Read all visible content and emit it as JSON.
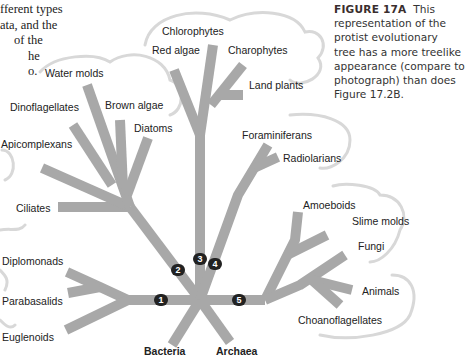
{
  "intro_text": {
    "lines": [
      "fferent types",
      "ata, and the",
      "of the",
      "he",
      "o."
    ]
  },
  "caption": {
    "figure_label": "FIGURE 17A",
    "lines": [
      "This",
      "representation of the",
      "protist evolutionary",
      "tree has a more treelike",
      "appearance (compare to",
      "photograph) than does",
      "Figure 17.2B."
    ]
  },
  "colors": {
    "branch": "#a8a8a8",
    "cloud_outline": "#d6d6d6",
    "node_fill": "#222222",
    "node_text": "#ffffff"
  },
  "tree": {
    "labels": {
      "chlorophytes": "Chlorophytes",
      "red_algae": "Red algae",
      "charophytes": "Charophytes",
      "land_plants": "Land plants",
      "water_molds": "Water molds",
      "dinoflagellates": "Dinoflagellates",
      "brown_algae": "Brown algae",
      "diatoms": "Diatoms",
      "apicomplexans": "Apicomplexans",
      "ciliates": "Ciliates",
      "foraminiferans": "Foraminiferans",
      "radiolarians": "Radiolarians",
      "amoeboids": "Amoeboids",
      "slime_molds": "Slime molds",
      "fungi": "Fungi",
      "animals": "Animals",
      "choanoflagellates": "Choanoflagellates",
      "diplomonads": "Diplomonads",
      "parabasalids": "Parabasalids",
      "euglenoids": "Euglenoids",
      "bacteria": "Bacteria",
      "archaea": "Archaea"
    },
    "nodes": [
      "1",
      "2",
      "3",
      "4",
      "5"
    ]
  }
}
